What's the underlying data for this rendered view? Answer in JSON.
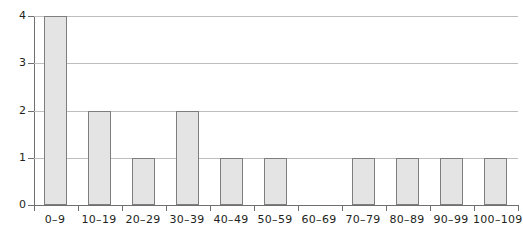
{
  "caption_fragment": "g",
  "chart_data": {
    "type": "bar",
    "title": "",
    "subtitle": "",
    "xlabel": "",
    "ylabel": "",
    "categories": [
      "0–9",
      "10–19",
      "20–29",
      "30–39",
      "40–49",
      "50–59",
      "60–69",
      "70–79",
      "80–89",
      "90–99",
      "100–109"
    ],
    "values": [
      4,
      2,
      1,
      2,
      1,
      1,
      0,
      1,
      1,
      1,
      1
    ],
    "ylim": [
      0,
      4
    ],
    "yticks": [
      0,
      1,
      2,
      3,
      4
    ],
    "ytick_labels": [
      "0",
      "1",
      "2",
      "3",
      "4"
    ],
    "grid": true,
    "grid_axis": "y",
    "legend": false,
    "legend_position": "none",
    "bar_fill_color": "#e4e4e4",
    "bar_edge_color": "#7e7e7e",
    "gridline_color": "#bdbdbd",
    "axis_color": "#6f6f6f",
    "background_color": "#ffffff"
  }
}
